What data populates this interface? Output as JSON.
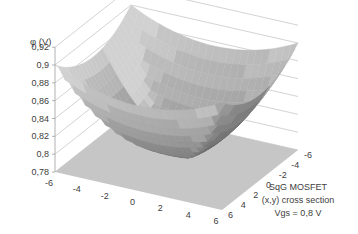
{
  "chart_data": {
    "type": "surface",
    "title": "",
    "zlabel": "φ (V)",
    "xlabel": "",
    "ylabel": "",
    "zlim": [
      0.78,
      0.92
    ],
    "z_ticks": [
      "0,78",
      "0,8",
      "0,82",
      "0,84",
      "0,86",
      "0,88",
      "0,9",
      "0,92"
    ],
    "x_ticks": [
      "-6",
      "-4",
      "-2",
      "0",
      "2",
      "4",
      "6"
    ],
    "y_ticks": [
      "-6",
      "-4",
      "-2",
      "0",
      "2",
      "4",
      "6"
    ],
    "x_range": [
      -6,
      6
    ],
    "y_range": [
      -6,
      6
    ],
    "grid": [
      {
        "x": -6,
        "y": -6,
        "z": 0.9
      },
      {
        "x": -6,
        "y": 0,
        "z": 0.84
      },
      {
        "x": -6,
        "y": 6,
        "z": 0.9
      },
      {
        "x": 0,
        "y": -6,
        "z": 0.84
      },
      {
        "x": 0,
        "y": 0,
        "z": 0.79
      },
      {
        "x": 0,
        "y": 6,
        "z": 0.84
      },
      {
        "x": 6,
        "y": -6,
        "z": 0.9
      },
      {
        "x": 6,
        "y": 0,
        "z": 0.84
      },
      {
        "x": 6,
        "y": 6,
        "z": 0.9
      }
    ],
    "annotation": [
      "SqG MOSFET",
      "(x,y) cross section",
      "Vgs = 0,8 V"
    ]
  },
  "annotation": {
    "line1": "SqG MOSFET",
    "line2": "(x,y) cross section",
    "line3": "Vgs = 0,8 V"
  },
  "axis": {
    "z_title": "φ (V)"
  },
  "colors": {
    "floor": "#c6c6c6",
    "surface_dark": "#4a4a4a",
    "surface_light": "#b8b8b8",
    "grid": "#c8c8c8",
    "text": "#404040"
  }
}
